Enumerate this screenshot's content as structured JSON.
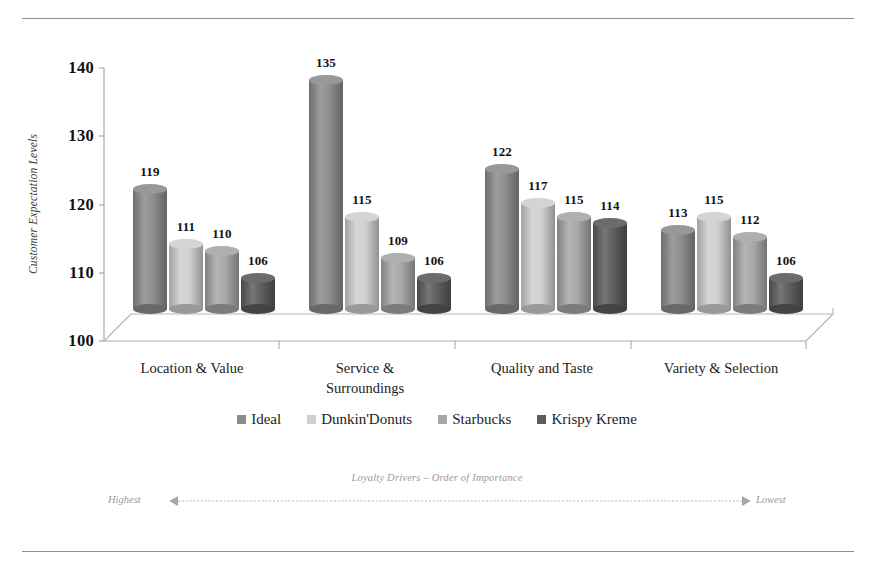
{
  "chart_data": {
    "type": "bar",
    "title": "",
    "subtitle": "",
    "xlabel": "",
    "ylabel": "Customer Expectation Levels",
    "ylim": [
      100,
      140
    ],
    "yticks": [
      100,
      110,
      120,
      130,
      140
    ],
    "grid": false,
    "legend_position": "bottom",
    "categories": [
      "Location & Value",
      "Service &\nSurroundings",
      "Quality and Taste",
      "Variety & Selection"
    ],
    "series": [
      {
        "name": "Ideal",
        "color": "#8c8c8c",
        "values": [
          119,
          135,
          122,
          113
        ]
      },
      {
        "name": "Dunkin'Donuts",
        "color": "#cfcfcf",
        "values": [
          111,
          115,
          117,
          115
        ]
      },
      {
        "name": "Starbucks",
        "color": "#a6a6a6",
        "values": [
          110,
          109,
          115,
          112
        ]
      },
      {
        "name": "Krispy Kreme",
        "color": "#5c5c5c",
        "values": [
          106,
          106,
          114,
          106
        ]
      }
    ],
    "annotations": {
      "footer_note": "Loyalty Drivers – Order of Importance",
      "arrow_left_label": "Highest",
      "arrow_right_label": "Lowest"
    }
  },
  "colors": {
    "frame_rule": "#8e8e8e",
    "axis_line": "#a9a9a9",
    "floor_line": "#b5b5b5",
    "annotation_text": "#9a9a9a",
    "label_text": "#1c1c1c"
  },
  "icons": {
    "arrow_left": "arrow-left-icon",
    "arrow_right": "arrow-right-icon"
  }
}
